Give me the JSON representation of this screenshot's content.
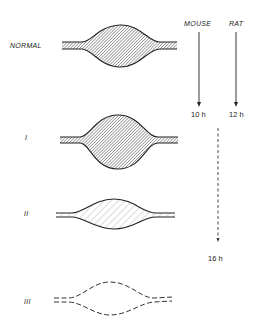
{
  "stages": [
    {
      "id": "normal",
      "label": "NORMAL",
      "fill": "dense-hatch",
      "outline": "solid"
    },
    {
      "id": "stage-1",
      "label": "I",
      "fill": "dense-hatch",
      "outline": "solid"
    },
    {
      "id": "stage-2",
      "label": "II",
      "fill": "sparse-hatch",
      "outline": "solid"
    },
    {
      "id": "stage-3",
      "label": "III",
      "fill": "none",
      "outline": "dashed"
    }
  ],
  "timeline": {
    "mouse": {
      "label": "MOUSE",
      "time": "10 h"
    },
    "rat": {
      "label": "RAT",
      "time": "12 h"
    },
    "extended": {
      "time": "16 h",
      "style": "dashed"
    }
  },
  "colors": {
    "ink": "#222222",
    "background": "#ffffff"
  }
}
